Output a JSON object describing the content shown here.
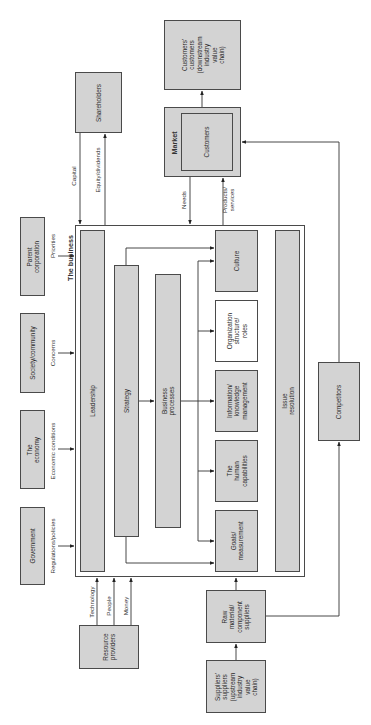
{
  "diagram": {
    "title": "The business",
    "external": {
      "shareholders": "Shareholders",
      "customers_customers": "Customers'\ncustomers\n(downstream\nindustry value\nchain)",
      "market": "Market",
      "customers": "Customers",
      "parent_corporation": "Parent corporation",
      "society_community": "Society/community",
      "the_economy": "The economy",
      "government": "Government",
      "competitors": "Competitors",
      "resource_providers": "Resource\nproviders",
      "raw_material_suppliers": "Raw\nmaterial/\ncomponent\nsuppliers",
      "suppliers_suppliers": "Suppliers'\nsuppliers\n(upstream\nindustry\nvalue chain)"
    },
    "internal": {
      "leadership": "Leadership",
      "strategy": "Strategy",
      "business_processes": "Business processes",
      "culture": "Culture",
      "organization_structure": "Organization\nstructure/\nroles",
      "information_management": "Information/\nknowledge\nmanagement",
      "human_capabilities": "The human\ncapabilities",
      "goals_measurement": "Goals/\nmeasurement",
      "issue_resolution": "Issue resolution"
    },
    "flows": {
      "capital": "Capital",
      "equity_dividends": "Equity/dividends",
      "needs": "Needs",
      "products_services": "Products/\nservices",
      "priorities": "Priorities",
      "concerns": "Concerns",
      "economic_conditions": "Economic conditions",
      "regulations_policies": "Regulations/policies",
      "technology": "Technology",
      "people": "People",
      "money": "Money"
    }
  }
}
